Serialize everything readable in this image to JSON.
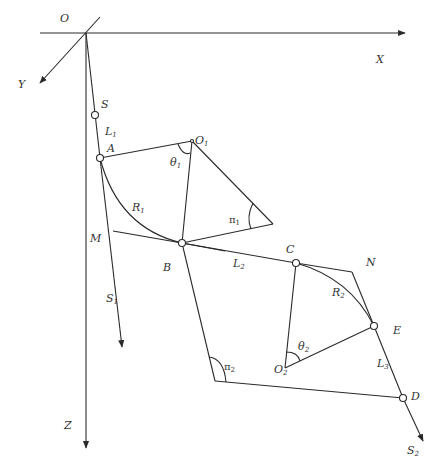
{
  "figure": {
    "type": "geometric-diagram",
    "colors": {
      "line": "#2a2a2a",
      "text": "#333333",
      "background": "#ffffff"
    }
  },
  "axes": {
    "origin_label": "O",
    "x_label": "X",
    "y_label": "Y",
    "z_label": "Z"
  },
  "points": {
    "S": "S",
    "A": "A",
    "O1": {
      "main": "O",
      "sub": "1"
    },
    "M": "M",
    "B": "B",
    "S1": {
      "main": "S",
      "sub": "1"
    },
    "C": "C",
    "N": "N",
    "E": "E",
    "O2": {
      "main": "O",
      "sub": "2"
    },
    "D": "D",
    "S2": {
      "main": "S",
      "sub": "2"
    }
  },
  "segments": {
    "L1": {
      "main": "L",
      "sub": "1"
    },
    "L2": {
      "main": "L",
      "sub": "2"
    },
    "L3": {
      "main": "L",
      "sub": "3"
    },
    "R1": {
      "main": "R",
      "sub": "1"
    },
    "R2": {
      "main": "R",
      "sub": "2"
    }
  },
  "angles": {
    "theta1": {
      "main": "θ",
      "sub": "1"
    },
    "theta2": {
      "main": "θ",
      "sub": "2"
    },
    "pi1": {
      "main": "π",
      "sub": "1"
    },
    "pi2": {
      "main": "π",
      "sub": "2"
    }
  }
}
